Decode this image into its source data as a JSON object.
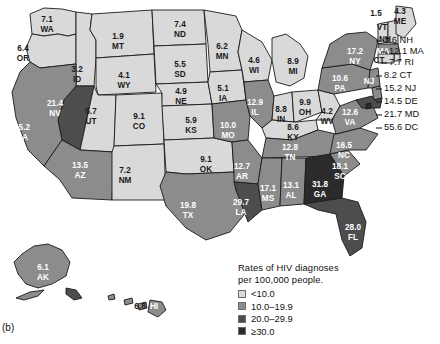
{
  "figure": {
    "panel_letter": "(b)",
    "legend_title_line1": "Rates of HIV diagnoses",
    "legend_title_line2": "per 100,000 people."
  },
  "legend": {
    "items": [
      {
        "label": "<10.0",
        "color": "#d9d9d9"
      },
      {
        "label": "10.0–19.9",
        "color": "#8c8c8c"
      },
      {
        "label": "20.0–29.9",
        "color": "#4d4d4d"
      },
      {
        "label": "≥30.0",
        "color": "#2b2b2b"
      }
    ]
  },
  "colors": {
    "tier1": "#d9d9d9",
    "tier2": "#8c8c8c",
    "tier3": "#4d4d4d",
    "tier4": "#2b2b2b",
    "outline": "#1a1a1a",
    "text_on_light": "#1a1a1a",
    "text_on_dark": "#ffffff"
  },
  "chart_data": {
    "type": "map",
    "title": "Rates of HIV diagnoses per 100,000 people.",
    "value_unit": "diagnoses per 100,000 people",
    "bins": [
      {
        "label": "<10.0",
        "min": 0,
        "max": 9.99,
        "color": "#d9d9d9"
      },
      {
        "label": "10.0–19.9",
        "min": 10,
        "max": 19.9,
        "color": "#8c8c8c"
      },
      {
        "label": "20.0–29.9",
        "min": 20,
        "max": 29.9,
        "color": "#4d4d4d"
      },
      {
        "label": "≥30.0",
        "min": 30,
        "max": 999,
        "color": "#2b2b2b"
      }
    ],
    "regions": [
      {
        "abbr": "WA",
        "value": 7.1,
        "tier": 1
      },
      {
        "abbr": "OR",
        "value": 6.4,
        "tier": 1
      },
      {
        "abbr": "ID",
        "value": 3.2,
        "tier": 1
      },
      {
        "abbr": "MT",
        "value": 1.9,
        "tier": 1
      },
      {
        "abbr": "ND",
        "value": 7.4,
        "tier": 1
      },
      {
        "abbr": "MN",
        "value": 6.2,
        "tier": 1
      },
      {
        "abbr": "WI",
        "value": 4.6,
        "tier": 1
      },
      {
        "abbr": "MI",
        "value": 8.9,
        "tier": 1
      },
      {
        "abbr": "SD",
        "value": 5.5,
        "tier": 1
      },
      {
        "abbr": "WY",
        "value": 4.1,
        "tier": 1
      },
      {
        "abbr": "NE",
        "value": 4.9,
        "tier": 1
      },
      {
        "abbr": "IA",
        "value": 5.1,
        "tier": 1
      },
      {
        "abbr": "NV",
        "value": 21.4,
        "tier": 3
      },
      {
        "abbr": "CA",
        "value": 15.2,
        "tier": 2
      },
      {
        "abbr": "UT",
        "value": 5.7,
        "tier": 1
      },
      {
        "abbr": "CO",
        "value": 9.1,
        "tier": 1
      },
      {
        "abbr": "KS",
        "value": 5.9,
        "tier": 1
      },
      {
        "abbr": "MO",
        "value": 10.0,
        "tier": 2
      },
      {
        "abbr": "IL",
        "value": 12.9,
        "tier": 2
      },
      {
        "abbr": "IN",
        "value": 8.8,
        "tier": 1
      },
      {
        "abbr": "OH",
        "value": 9.9,
        "tier": 1
      },
      {
        "abbr": "WV",
        "value": 4.2,
        "tier": 1
      },
      {
        "abbr": "KY",
        "value": 8.6,
        "tier": 1
      },
      {
        "abbr": "AZ",
        "value": 13.5,
        "tier": 2
      },
      {
        "abbr": "NM",
        "value": 7.2,
        "tier": 1
      },
      {
        "abbr": "OK",
        "value": 9.1,
        "tier": 1
      },
      {
        "abbr": "TX",
        "value": 19.8,
        "tier": 2
      },
      {
        "abbr": "AR",
        "value": 12.7,
        "tier": 2
      },
      {
        "abbr": "LA",
        "value": 29.7,
        "tier": 3
      },
      {
        "abbr": "MS",
        "value": 17.1,
        "tier": 2
      },
      {
        "abbr": "AL",
        "value": 13.1,
        "tier": 2
      },
      {
        "abbr": "GA",
        "value": 31.8,
        "tier": 4
      },
      {
        "abbr": "TN",
        "value": 12.8,
        "tier": 2
      },
      {
        "abbr": "NC",
        "value": 16.5,
        "tier": 2
      },
      {
        "abbr": "SC",
        "value": 18.1,
        "tier": 2
      },
      {
        "abbr": "VA",
        "value": 12.6,
        "tier": 2
      },
      {
        "abbr": "PA",
        "value": 10.6,
        "tier": 2
      },
      {
        "abbr": "NY",
        "value": 17.2,
        "tier": 2
      },
      {
        "abbr": "VT",
        "value": 1.5,
        "tier": 1
      },
      {
        "abbr": "ME",
        "value": 4.3,
        "tier": 1
      },
      {
        "abbr": "FL",
        "value": 28.0,
        "tier": 3
      },
      {
        "abbr": "AK",
        "value": 6.1,
        "tier": 2
      },
      {
        "abbr": "HI",
        "value": 6.8,
        "tier": 2
      },
      {
        "abbr": "NH",
        "value": 3.6,
        "tier": 1
      },
      {
        "abbr": "MA",
        "value": 12.1,
        "tier": 2
      },
      {
        "abbr": "RI",
        "value": 7.7,
        "tier": 1
      },
      {
        "abbr": "CT",
        "value": 8.2,
        "tier": 1
      },
      {
        "abbr": "NJ",
        "value": 15.2,
        "tier": 2
      },
      {
        "abbr": "DE",
        "value": 14.5,
        "tier": 2
      },
      {
        "abbr": "MD",
        "value": 21.7,
        "tier": 3
      },
      {
        "abbr": "DC",
        "value": 55.6,
        "tier": 4
      }
    ]
  },
  "map_labels": [
    {
      "abbr": "WA",
      "value": "7.1",
      "x": 47,
      "y": 20,
      "dark_bg": false
    },
    {
      "abbr": "OR",
      "value": "6.4",
      "x": 23,
      "y": 49,
      "dark_bg": false
    },
    {
      "abbr": "ID",
      "value": "3.2",
      "x": 77,
      "y": 70,
      "dark_bg": false
    },
    {
      "abbr": "MT",
      "value": "1.9",
      "x": 118,
      "y": 37,
      "dark_bg": false
    },
    {
      "abbr": "ND",
      "value": "7.4",
      "x": 180,
      "y": 25,
      "dark_bg": false
    },
    {
      "abbr": "MN",
      "value": "6.2",
      "x": 222,
      "y": 47,
      "dark_bg": false
    },
    {
      "abbr": "WI",
      "value": "4.6",
      "x": 254,
      "y": 61,
      "dark_bg": false
    },
    {
      "abbr": "MI",
      "value": "8.9",
      "x": 293,
      "y": 62,
      "dark_bg": false
    },
    {
      "abbr": "SD",
      "value": "5.5",
      "x": 180,
      "y": 65,
      "dark_bg": false
    },
    {
      "abbr": "WY",
      "value": "4.1",
      "x": 124,
      "y": 76,
      "dark_bg": false
    },
    {
      "abbr": "NE",
      "value": "4.9",
      "x": 181,
      "y": 92,
      "dark_bg": false
    },
    {
      "abbr": "IA",
      "value": "5.1",
      "x": 223,
      "y": 89,
      "dark_bg": false
    },
    {
      "abbr": "NV",
      "value": "21.4",
      "x": 55,
      "y": 104,
      "dark_bg": true
    },
    {
      "abbr": "CA",
      "value": "15.2",
      "x": 22,
      "y": 128,
      "dark_bg": true
    },
    {
      "abbr": "UT",
      "value": "5.7",
      "x": 91,
      "y": 112,
      "dark_bg": false
    },
    {
      "abbr": "CO",
      "value": "9.1",
      "x": 139,
      "y": 117,
      "dark_bg": false
    },
    {
      "abbr": "KS",
      "value": "5.9",
      "x": 191,
      "y": 121,
      "dark_bg": false
    },
    {
      "abbr": "MO",
      "value": "10.0",
      "x": 228,
      "y": 126,
      "dark_bg": true
    },
    {
      "abbr": "IL",
      "value": "12.9",
      "x": 255,
      "y": 103,
      "dark_bg": true
    },
    {
      "abbr": "IN",
      "value": "8.8",
      "x": 281,
      "y": 110,
      "dark_bg": false
    },
    {
      "abbr": "OH",
      "value": "9.9",
      "x": 305,
      "y": 103,
      "dark_bg": false
    },
    {
      "abbr": "WV",
      "value": "4.2",
      "x": 327,
      "y": 112,
      "dark_bg": false
    },
    {
      "abbr": "KY",
      "value": "8.6",
      "x": 293,
      "y": 128,
      "dark_bg": false
    },
    {
      "abbr": "AZ",
      "value": "13.5",
      "x": 80,
      "y": 166,
      "dark_bg": true
    },
    {
      "abbr": "NM",
      "value": "7.2",
      "x": 125,
      "y": 171,
      "dark_bg": false
    },
    {
      "abbr": "OK",
      "value": "9.1",
      "x": 206,
      "y": 160,
      "dark_bg": false
    },
    {
      "abbr": "TX",
      "value": "19.8",
      "x": 188,
      "y": 206,
      "dark_bg": true
    },
    {
      "abbr": "AR",
      "value": "12.7",
      "x": 242,
      "y": 167,
      "dark_bg": true
    },
    {
      "abbr": "LA",
      "value": "29.7",
      "x": 241,
      "y": 203,
      "dark_bg": true
    },
    {
      "abbr": "MS",
      "value": "17.1",
      "x": 268,
      "y": 189,
      "dark_bg": true
    },
    {
      "abbr": "AL",
      "value": "13.1",
      "x": 291,
      "y": 186,
      "dark_bg": true
    },
    {
      "abbr": "GA",
      "value": "31.8",
      "x": 320,
      "y": 185,
      "dark_bg": true
    },
    {
      "abbr": "TN",
      "value": "12.8",
      "x": 290,
      "y": 148,
      "dark_bg": true
    },
    {
      "abbr": "NC",
      "value": "16.5",
      "x": 344,
      "y": 146,
      "dark_bg": true
    },
    {
      "abbr": "SC",
      "value": "18.1",
      "x": 340,
      "y": 167,
      "dark_bg": true
    },
    {
      "abbr": "VA",
      "value": "12.6",
      "x": 350,
      "y": 113,
      "dark_bg": true
    },
    {
      "abbr": "PA",
      "value": "10.6",
      "x": 340,
      "y": 79,
      "dark_bg": true
    },
    {
      "abbr": "NY",
      "value": "17.2",
      "x": 355,
      "y": 52,
      "dark_bg": true
    },
    {
      "abbr": "FL",
      "value": "28.0",
      "x": 353,
      "y": 228,
      "dark_bg": true
    },
    {
      "abbr": "AK",
      "value": "6.1",
      "x": 43,
      "y": 268,
      "dark_bg": true
    }
  ],
  "small_labels": [
    {
      "abbr": "VT",
      "value": "1.5",
      "vx": 376,
      "vy": 14,
      "ax": 382,
      "ay": 28
    },
    {
      "abbr": "ME",
      "value": "4.3",
      "vx": 400,
      "vy": 12,
      "ax": 400,
      "ay": 22
    },
    {
      "abbr": "NH",
      "vx": 0,
      "vy": 0,
      "ax": 385,
      "ay": 40
    },
    {
      "abbr": "MA",
      "vx": 0,
      "vy": 0,
      "ax": 383,
      "ay": 52
    },
    {
      "abbr": "CT",
      "vx": 0,
      "vy": 0,
      "ax": 379,
      "ay": 61
    },
    {
      "abbr": "NJ",
      "vx": 0,
      "vy": 0,
      "ax": 369,
      "ay": 82
    },
    {
      "abbr": "HI",
      "vx": 0,
      "vy": 0,
      "ax": 154,
      "ay": 307
    }
  ],
  "hawaii_label": {
    "value": "6.8",
    "x": 140,
    "y": 307
  },
  "callouts": [
    {
      "text": "3.6 NH",
      "x": 384,
      "y": 41,
      "lead_x1": 376,
      "lead_y1": 41
    },
    {
      "text": "12.1 MA",
      "x": 389,
      "y": 52,
      "lead_x1": 381,
      "lead_y1": 52
    },
    {
      "text": "7.7 RI",
      "x": 389,
      "y": 63,
      "lead_x1": 381,
      "lead_y1": 63
    },
    {
      "text": "8.2 CT",
      "x": 384,
      "y": 76,
      "lead_x1": 376,
      "lead_y1": 76
    },
    {
      "text": "15.2 NJ",
      "x": 384,
      "y": 89,
      "lead_x1": 376,
      "lead_y1": 89
    },
    {
      "text": "14.5 DE",
      "x": 384,
      "y": 102,
      "lead_x1": 376,
      "lead_y1": 102
    },
    {
      "text": "21.7 MD",
      "x": 384,
      "y": 115,
      "lead_x1": 376,
      "lead_y1": 115
    },
    {
      "text": "55.6 DC",
      "x": 384,
      "y": 128,
      "lead_x1": 376,
      "lead_y1": 128
    }
  ]
}
